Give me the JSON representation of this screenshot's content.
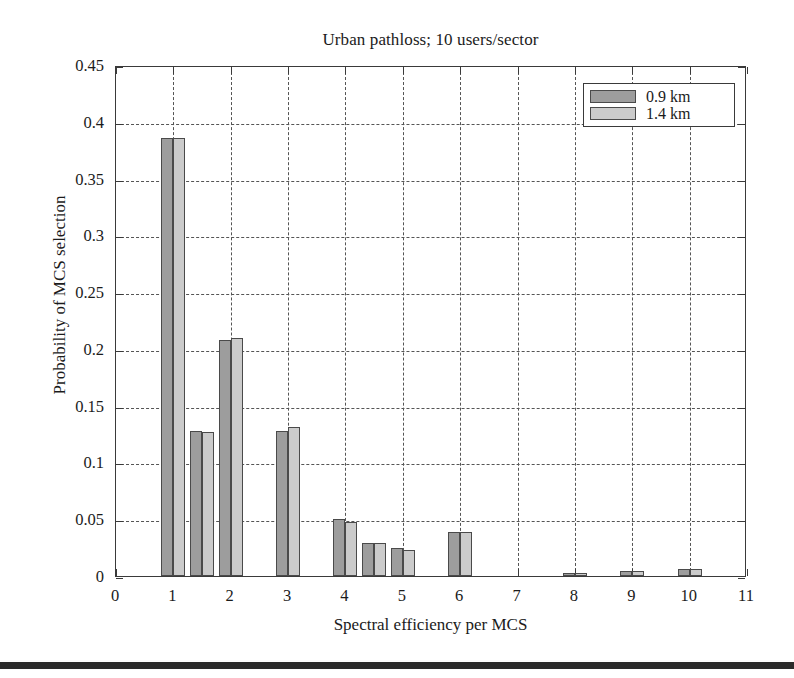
{
  "chart_data": {
    "type": "bar",
    "title": "Urban pathloss; 10 users/sector",
    "xlabel": "Spectral efficiency per MCS",
    "ylabel": "Probability of MCS selection",
    "xlim": [
      0,
      11
    ],
    "ylim": [
      0,
      0.45
    ],
    "grid": true,
    "legend_position": "top-right",
    "xticks": [
      "0",
      "1",
      "2",
      "3",
      "4",
      "5",
      "6",
      "7",
      "8",
      "9",
      "10",
      "11"
    ],
    "xtick_values": [
      0,
      1,
      2,
      3,
      4,
      5,
      6,
      7,
      8,
      9,
      10,
      11
    ],
    "yticks": [
      "0",
      "0.05",
      "0.1",
      "0.15",
      "0.2",
      "0.25",
      "0.3",
      "0.35",
      "0.4",
      "0.45"
    ],
    "ytick_values": [
      0,
      0.05,
      0.1,
      0.15,
      0.2,
      0.25,
      0.3,
      0.35,
      0.4,
      0.45
    ],
    "x": [
      1,
      1.5,
      2,
      3,
      4,
      4.5,
      5,
      6,
      8,
      9,
      10
    ],
    "series": [
      {
        "name": "0.9 km",
        "color": "#9d9d9d",
        "values": [
          0.386,
          0.128,
          0.208,
          0.128,
          0.05,
          0.029,
          0.025,
          0.039,
          0.003,
          0.004,
          0.006
        ]
      },
      {
        "name": "1.4 km",
        "color": "#cbcbcb",
        "values": [
          0.386,
          0.127,
          0.21,
          0.131,
          0.048,
          0.029,
          0.023,
          0.039,
          0.003,
          0.004,
          0.006
        ]
      }
    ]
  },
  "legend": {
    "entries": [
      {
        "label": "0.9 km"
      },
      {
        "label": "1.4 km"
      }
    ]
  }
}
